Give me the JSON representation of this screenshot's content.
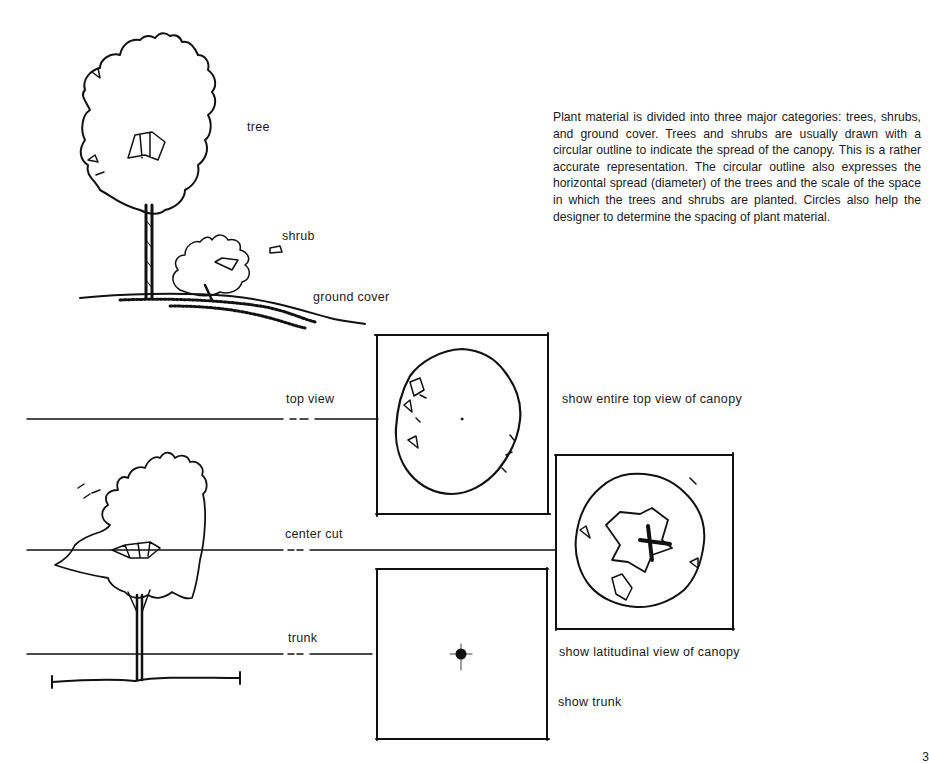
{
  "paragraph": "Plant material is divided into three major categories: trees, shrubs, and ground cover. Trees and shrubs are usually drawn with a circular outline to indicate the spread of the canopy. This is a rather accurate representation. The circular outline also expresses the horizontal spread (diameter) of the trees and the scale of the space in which the trees and shrubs are planted. Circles also help the designer to determine the spacing of plant material.",
  "labels": {
    "tree": "tree",
    "shrub": "shrub",
    "ground_cover": "ground cover",
    "top_view": "top view",
    "center_cut": "center cut",
    "trunk": "trunk"
  },
  "captions": {
    "top_view": "show entire top view of canopy",
    "latitudinal": "show latitudinal view of canopy",
    "trunk": "show trunk"
  },
  "page_number": "3",
  "colors": {
    "ink": "#111111",
    "paper": "#ffffff"
  }
}
